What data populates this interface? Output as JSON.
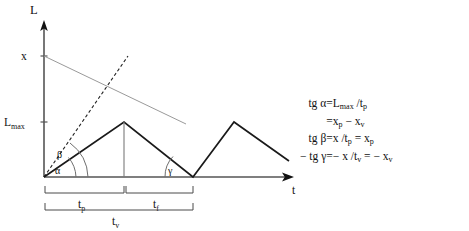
{
  "figure": {
    "axes": {
      "y_axis_label": "L",
      "x_axis_label": "t",
      "y_ticks": [
        {
          "label": "x",
          "value_y": 56
        },
        {
          "label": "L",
          "sub": "max",
          "value_y": 122
        }
      ]
    },
    "angle_labels": [
      {
        "name": "alpha",
        "glyph": "α"
      },
      {
        "name": "beta",
        "glyph": "β"
      },
      {
        "name": "gamma",
        "glyph": "γ"
      }
    ],
    "interval_labels": [
      {
        "name": "t-p",
        "base": "t",
        "sub": "p"
      },
      {
        "name": "t-f",
        "base": "t",
        "sub": "f"
      },
      {
        "name": "t-v",
        "base": "t",
        "sub": "v"
      }
    ]
  },
  "equations": [
    {
      "lhs": "tg α",
      "eq": "=",
      "rhs_parts": [
        {
          "text": "L"
        },
        {
          "text": "max",
          "sub": true
        },
        {
          "text": " /t"
        },
        {
          "text": "p",
          "sub": true
        }
      ]
    },
    {
      "lhs": "",
      "eq": "=",
      "rhs_parts": [
        {
          "text": "x"
        },
        {
          "text": "p",
          "sub": true
        },
        {
          "text": " − x"
        },
        {
          "text": "v",
          "sub": true
        }
      ]
    },
    {
      "lhs": "tg β",
      "eq": "=",
      "rhs_parts": [
        {
          "text": "x /t"
        },
        {
          "text": "p",
          "sub": true
        },
        {
          "text": " = x"
        },
        {
          "text": "p",
          "sub": true
        }
      ]
    },
    {
      "lhs": "− tg γ",
      "eq": "=",
      "rhs_parts": [
        {
          "text": "− x /t"
        },
        {
          "text": "v",
          "sub": true
        },
        {
          "text": " = − x"
        },
        {
          "text": "v",
          "sub": true
        }
      ]
    }
  ],
  "chart_data": {
    "type": "line",
    "title": "",
    "xlabel": "t",
    "ylabel": "L",
    "grid": false,
    "legend": "none",
    "xlim": [
      0,
      250
    ],
    "ylim": [
      0,
      155
    ],
    "ytick_labels": [
      "L_max",
      "x"
    ],
    "ytick_values": [
      55,
      121
    ],
    "annotations": [
      "α",
      "β",
      "γ",
      "t_p",
      "t_f",
      "t_v"
    ],
    "series": [
      {
        "name": "sawtooth-profile",
        "style": "solid",
        "color": "#1a1a1a",
        "x": [
          0,
          80,
          149,
          190,
          245
        ],
        "y": [
          0,
          55,
          0,
          55,
          39
        ]
      },
      {
        "name": "beta-dashed-line",
        "style": "dashed",
        "color": "#1a1a1a",
        "x": [
          0,
          84
        ],
        "y": [
          0,
          121
        ]
      },
      {
        "name": "x-decay-line",
        "style": "thin-solid",
        "color": "#8a8a8a",
        "x": [
          0,
          142
        ],
        "y": [
          121,
          53
        ]
      },
      {
        "name": "peak-drop-line",
        "style": "thin-solid",
        "color": "#6a6a6a",
        "x": [
          80,
          80
        ],
        "y": [
          55,
          0
        ]
      }
    ]
  }
}
